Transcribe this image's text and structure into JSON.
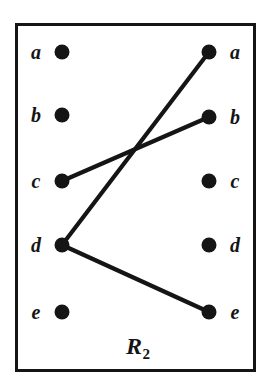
{
  "figure": {
    "caption_base": "R",
    "caption_subscript": "2",
    "caption_full": "R2",
    "frame_color": "#151515",
    "node_color": "#151515",
    "edge_color": "#151515",
    "background_color": "#ffffff"
  },
  "chart_data": {
    "type": "diagram",
    "subtype": "bipartite-relation-arrow-diagram",
    "title": "R2",
    "domain_label": "left",
    "codomain_label": "right",
    "left_nodes": [
      {
        "label": "a",
        "x": 62,
        "y": 52
      },
      {
        "label": "b",
        "x": 62,
        "y": 115
      },
      {
        "label": "c",
        "x": 62,
        "y": 181
      },
      {
        "label": "d",
        "x": 62,
        "y": 245
      },
      {
        "label": "e",
        "x": 62,
        "y": 312
      }
    ],
    "right_nodes": [
      {
        "label": "a",
        "x": 209,
        "y": 52
      },
      {
        "label": "b",
        "x": 209,
        "y": 117
      },
      {
        "label": "c",
        "x": 209,
        "y": 181
      },
      {
        "label": "d",
        "x": 209,
        "y": 245
      },
      {
        "label": "e",
        "x": 209,
        "y": 312
      }
    ],
    "edges": [
      {
        "from": "c",
        "to": "b",
        "x1": 62,
        "y1": 181,
        "x2": 209,
        "y2": 117
      },
      {
        "from": "d",
        "to": "a",
        "x1": 62,
        "y1": 245,
        "x2": 209,
        "y2": 52
      },
      {
        "from": "d",
        "to": "e",
        "x1": 62,
        "y1": 245,
        "x2": 209,
        "y2": 312
      }
    ],
    "edge_pairs": [
      "(c,b)",
      "(d,a)",
      "(d,e)"
    ],
    "node_radius": 7.5,
    "edge_width": 4.2,
    "left_label_x": 36,
    "right_label_x": 235,
    "caption_x": 138,
    "caption_y": 348,
    "frame": {
      "x": 15,
      "y": 23,
      "width": 241,
      "height": 349,
      "border_width": 3
    }
  }
}
